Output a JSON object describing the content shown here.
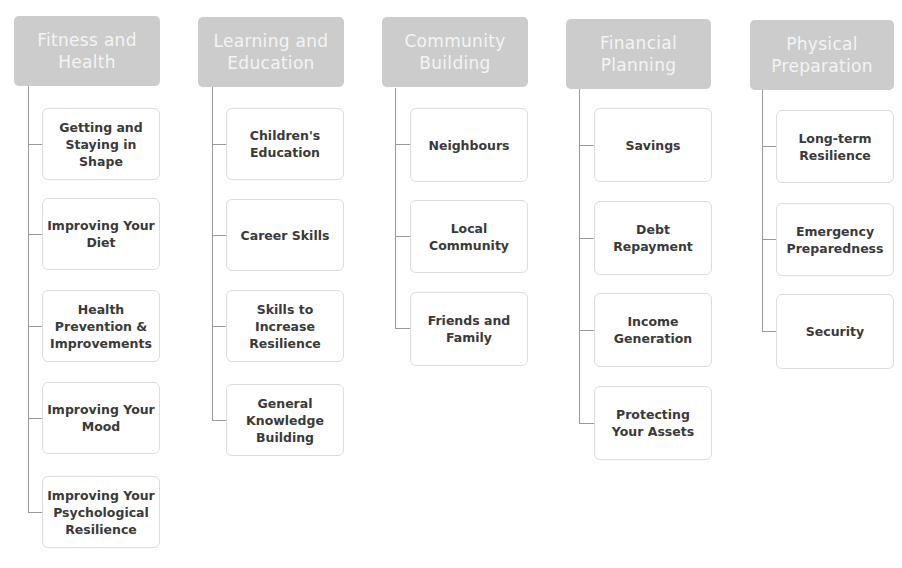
{
  "diagram": {
    "type": "hierarchy",
    "colors": {
      "header_bg": "#cccccc",
      "header_text": "#f4f4f4",
      "child_border": "#dcdcdc",
      "child_text": "#3a3a3a",
      "connector": "#9a9a9a"
    },
    "categories": [
      {
        "title": "Fitness and Health",
        "children": [
          "Getting and Staying in Shape",
          "Improving Your Diet",
          "Health Prevention & Improvements",
          "Improving Your Mood",
          "Improving Your Psychological Resilience"
        ]
      },
      {
        "title": "Learning and Education",
        "children": [
          "Children's Education",
          "Career Skills",
          "Skills to Increase Resilience",
          "General Knowledge Building"
        ]
      },
      {
        "title": "Community Building",
        "children": [
          "Neighbours",
          "Local Community",
          "Friends and Family"
        ]
      },
      {
        "title": "Financial Planning",
        "children": [
          "Savings",
          "Debt Repayment",
          "Income Generation",
          "Protecting Your Assets"
        ]
      },
      {
        "title": "Physical Preparation",
        "children": [
          "Long-term Resilience",
          "Emergency Preparedness",
          "Security"
        ]
      }
    ]
  }
}
